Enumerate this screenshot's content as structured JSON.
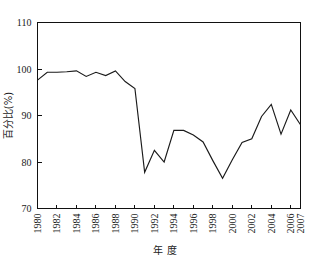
{
  "chart_data": {
    "type": "line",
    "title": "",
    "xlabel": "年  度",
    "ylabel": "百分比(%)",
    "xlim": [
      1980,
      2007
    ],
    "ylim": [
      70,
      110
    ],
    "ytick_values": [
      70,
      80,
      90,
      100,
      110
    ],
    "ytick_labels": [
      "70",
      "80",
      "90",
      "100",
      "110"
    ],
    "xtick_values": [
      1980,
      1982,
      1984,
      1986,
      1988,
      1990,
      1992,
      1994,
      1996,
      1998,
      2000,
      2002,
      2004,
      2006,
      2007
    ],
    "xtick_labels": [
      "1980",
      "1982",
      "1984",
      "1986",
      "1988",
      "1990",
      "1992",
      "1994",
      "1996",
      "1998",
      "2000",
      "2002",
      "2004",
      "2006",
      "2007"
    ],
    "grid": false,
    "legend": "none",
    "line_color": "#1a1a1a",
    "x": [
      1980,
      1981,
      1982,
      1983,
      1984,
      1985,
      1986,
      1987,
      1988,
      1989,
      1990,
      1991,
      1992,
      1993,
      1994,
      1995,
      1996,
      1997,
      1998,
      1999,
      2000,
      2001,
      2002,
      2003,
      2004,
      2005,
      2006,
      2007
    ],
    "values": [
      97.6,
      99.3,
      99.3,
      99.4,
      99.6,
      98.4,
      99.3,
      98.6,
      99.6,
      97.3,
      95.8,
      77.8,
      82.5,
      80.0,
      86.8,
      86.8,
      85.8,
      84.3,
      80.3,
      76.5,
      80.5,
      84.2,
      85.0,
      89.8,
      92.4,
      86.0,
      91.2,
      88.0
    ],
    "series": [
      {
        "name": "百分比",
        "values": [
          97.6,
          99.3,
          99.3,
          99.4,
          99.6,
          98.4,
          99.3,
          98.6,
          99.6,
          97.3,
          95.8,
          77.8,
          82.5,
          80.0,
          86.8,
          86.8,
          85.8,
          84.3,
          80.3,
          76.5,
          80.5,
          84.2,
          85.0,
          89.8,
          92.4,
          86.0,
          91.2,
          88.0
        ]
      }
    ]
  }
}
